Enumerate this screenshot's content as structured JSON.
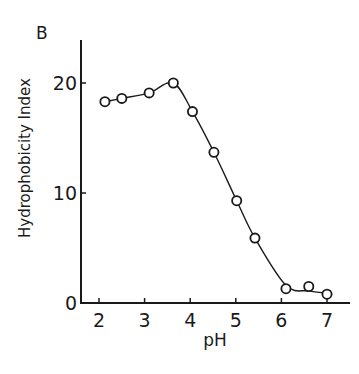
{
  "chart_data": {
    "type": "line",
    "panel_label": "B",
    "title": "",
    "xlabel": "pH",
    "ylabel": "Hydrophobicity Index",
    "xlim": [
      1.6,
      7.5
    ],
    "ylim": [
      0,
      24
    ],
    "xticks": [
      2,
      3,
      4,
      5,
      6,
      7
    ],
    "yticks": [
      0,
      10,
      20
    ],
    "grid": false,
    "legend": null,
    "markers": "open-circle",
    "smooth_fit_curve": true,
    "series": [
      {
        "name": "Hydrophobicity Index",
        "x": [
          2.13,
          2.5,
          3.1,
          3.63,
          4.05,
          4.52,
          5.02,
          5.42,
          6.1,
          6.6,
          7.0
        ],
        "y": [
          18.3,
          18.6,
          19.1,
          20.0,
          17.4,
          13.7,
          9.3,
          5.9,
          1.3,
          1.5,
          0.8
        ]
      }
    ]
  }
}
